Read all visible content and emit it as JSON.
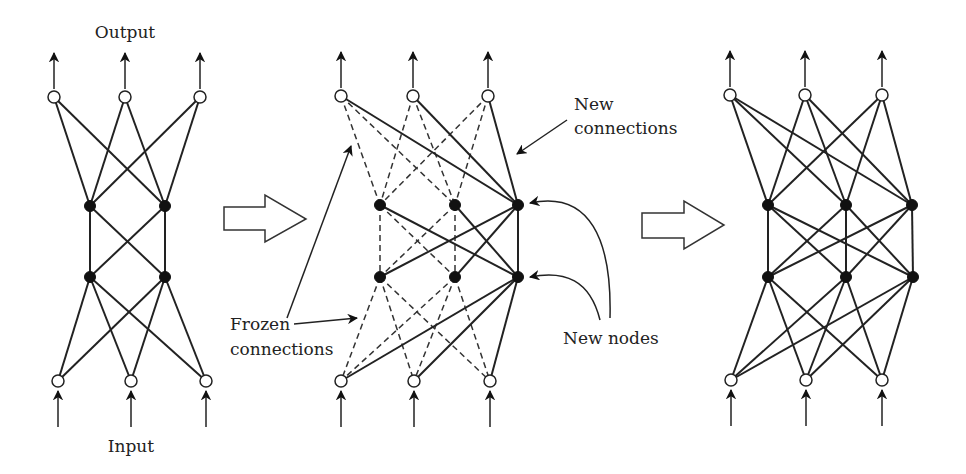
{
  "labels": {
    "output": "Output",
    "input": "Input",
    "new_connections_1": "New",
    "new_connections_2": "connections",
    "frozen_1": "Frozen",
    "frozen_2": "connections",
    "new_nodes": "New nodes"
  },
  "colors": {
    "line": "#222222",
    "filled_node": "#111111",
    "open_node": "#ffffff",
    "background": "#ffffff"
  },
  "networks": [
    {
      "name": "original-network",
      "outputs": [
        [
          54,
          97
        ],
        [
          125,
          97
        ],
        [
          200,
          97
        ]
      ],
      "hidden1": [
        [
          90,
          206
        ],
        [
          165,
          206
        ]
      ],
      "hidden2": [
        [
          90,
          277
        ],
        [
          165,
          277
        ]
      ],
      "inputs": [
        [
          58,
          381
        ],
        [
          131,
          381
        ],
        [
          206,
          381
        ]
      ],
      "edge_style": "solid"
    },
    {
      "name": "growing-network",
      "outputs": [
        [
          341,
          96
        ],
        [
          413,
          96
        ],
        [
          488,
          96
        ]
      ],
      "hidden1": [
        [
          380,
          205
        ],
        [
          455,
          205
        ]
      ],
      "hidden2": [
        [
          380,
          277
        ],
        [
          455,
          277
        ]
      ],
      "new_nodes": [
        [
          518,
          205
        ],
        [
          518,
          277
        ]
      ],
      "inputs": [
        [
          341,
          381
        ],
        [
          414,
          381
        ],
        [
          490,
          381
        ]
      ],
      "frozen_edge_style": "dashed",
      "new_edge_style": "solid"
    },
    {
      "name": "final-network",
      "outputs": [
        [
          730,
          95
        ],
        [
          805,
          95
        ],
        [
          882,
          95
        ]
      ],
      "hidden1": [
        [
          768,
          205
        ],
        [
          846,
          205
        ],
        [
          912,
          205
        ]
      ],
      "hidden2": [
        [
          768,
          277
        ],
        [
          846,
          277
        ],
        [
          913,
          277
        ]
      ],
      "inputs": [
        [
          731,
          380
        ],
        [
          806,
          380
        ],
        [
          882,
          380
        ]
      ],
      "edge_style": "solid"
    }
  ],
  "transition_arrows": [
    {
      "name": "arrow-1",
      "body_x": [
        224,
        265
      ],
      "body_y": [
        207,
        230
      ],
      "head_y": [
        195,
        242
      ],
      "tip": [
        306,
        219
      ]
    },
    {
      "name": "arrow-2",
      "body_x": [
        642,
        684
      ],
      "body_y": [
        213,
        238
      ],
      "head_y": [
        201,
        249
      ],
      "tip": [
        724,
        225
      ]
    }
  ]
}
